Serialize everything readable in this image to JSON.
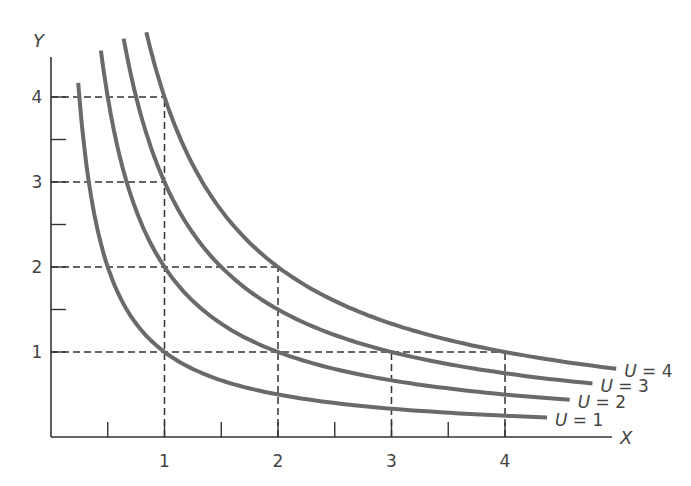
{
  "chart_data": {
    "type": "line",
    "title": "",
    "xlabel": "X",
    "ylabel": "Y",
    "xlim": [
      0,
      5
    ],
    "ylim": [
      0,
      4.5
    ],
    "x_ticks": [
      1,
      2,
      3,
      4
    ],
    "x_tick_labels": [
      "1",
      "2",
      "3",
      "4"
    ],
    "x_minor_ticks": [
      0.5,
      1.5,
      2.5,
      3.5
    ],
    "y_ticks": [
      1,
      2,
      3,
      4
    ],
    "y_tick_labels": [
      "1",
      "2",
      "3",
      "4"
    ],
    "y_minor_ticks": [
      1.5,
      2.5,
      3.5
    ],
    "grid": false,
    "series": [
      {
        "name": "U = 1",
        "label_var": "U",
        "label_value": "1",
        "function": "y = 1/x",
        "x_range": [
          0.24,
          4.37
        ],
        "points": [
          [
            0.25,
            4
          ],
          [
            0.5,
            2
          ],
          [
            1,
            1
          ],
          [
            2,
            0.5
          ],
          [
            3,
            0.33
          ],
          [
            4,
            0.25
          ]
        ]
      },
      {
        "name": "U = 2",
        "label_var": "U",
        "label_value": "2",
        "function": "y = 2/x",
        "x_range": [
          0.44,
          4.57
        ],
        "points": [
          [
            0.5,
            4
          ],
          [
            1,
            2
          ],
          [
            2,
            1
          ],
          [
            3,
            0.67
          ],
          [
            4,
            0.5
          ]
        ]
      },
      {
        "name": "U = 3",
        "label_var": "U",
        "label_value": "3",
        "function": "y = 3/x",
        "x_range": [
          0.64,
          4.77
        ],
        "points": [
          [
            0.75,
            4
          ],
          [
            1,
            3
          ],
          [
            2,
            1.5
          ],
          [
            3,
            1
          ],
          [
            4,
            0.75
          ]
        ]
      },
      {
        "name": "U = 4",
        "label_var": "U",
        "label_value": "4",
        "function": "y = 4/x",
        "x_range": [
          0.84,
          4.98
        ],
        "points": [
          [
            1,
            4
          ],
          [
            2,
            2
          ],
          [
            4,
            1
          ]
        ]
      }
    ],
    "reference_lines": [
      {
        "type": "horizontal",
        "y": 4,
        "from_x": 0,
        "to_x": 1
      },
      {
        "type": "horizontal",
        "y": 3,
        "from_x": 0,
        "to_x": 1
      },
      {
        "type": "horizontal",
        "y": 2,
        "from_x": 0,
        "to_x": 2
      },
      {
        "type": "horizontal",
        "y": 1,
        "from_x": 0,
        "to_x": 4
      },
      {
        "type": "vertical",
        "x": 1,
        "from_y": 0,
        "to_y": 4
      },
      {
        "type": "vertical",
        "x": 2,
        "from_y": 0,
        "to_y": 2
      },
      {
        "type": "vertical",
        "x": 3,
        "from_y": 0,
        "to_y": 1
      },
      {
        "type": "vertical",
        "x": 4,
        "from_y": 0,
        "to_y": 1
      }
    ],
    "legend": "inline labels at curve ends",
    "colors": {
      "curve": "#6a6a6a",
      "axis": "#333333",
      "dashed": "#333333",
      "text": "#444444"
    }
  }
}
